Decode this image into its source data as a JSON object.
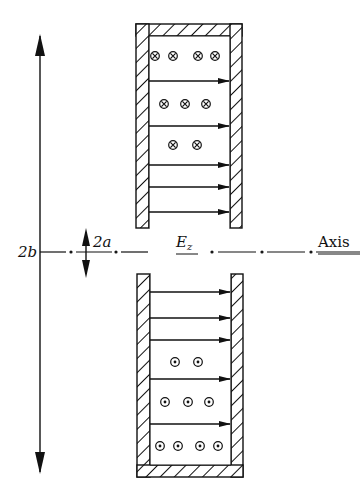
{
  "diagram": {
    "type": "coaxial cavity cross-section with E and B field lines",
    "labels": {
      "outer_diameter": "2b",
      "inner_diameter": "2a",
      "field": "E",
      "field_sub": "z",
      "axis": "Axis"
    },
    "colors": {
      "ink": "#111111",
      "background": "#ffffff"
    },
    "upper_section": {
      "field_arrow_rows": 5,
      "symbol": "cross (into page)",
      "symbol_rows": [
        {
          "count": 4
        },
        {
          "count": 3
        },
        {
          "count": 2
        }
      ]
    },
    "lower_section": {
      "field_arrow_rows": 5,
      "symbol": "dot (out of page)",
      "symbol_rows": [
        {
          "count": 2
        },
        {
          "count": 3
        },
        {
          "count": 4
        }
      ]
    }
  }
}
